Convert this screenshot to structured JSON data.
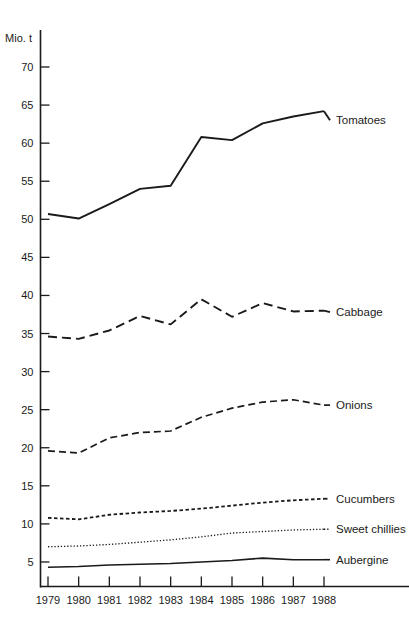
{
  "chart_data": {
    "type": "line",
    "title": "",
    "subtitle": "",
    "xlabel": "",
    "ylabel": "Mio. t",
    "unit_label": "Mio. t",
    "x": [
      1979,
      1980,
      1981,
      1982,
      1983,
      1984,
      1985,
      1986,
      1987,
      1988
    ],
    "categories": [
      "1979",
      "1980",
      "1981",
      "1982",
      "1983",
      "1984",
      "1985",
      "1986",
      "1987",
      "1988"
    ],
    "xtick_labels": [
      "1979",
      "1980",
      "1981",
      "1982",
      "1983",
      "1984",
      "1985",
      "1986",
      "1987",
      "1988"
    ],
    "ytick_labels": [
      "5",
      "10",
      "15",
      "20",
      "25",
      "30",
      "35",
      "40",
      "45",
      "50",
      "55",
      "60",
      "65",
      "70"
    ],
    "yticks": [
      5,
      10,
      15,
      20,
      25,
      30,
      35,
      40,
      45,
      50,
      55,
      60,
      65,
      70
    ],
    "ylim": [
      2,
      72
    ],
    "xlim": [
      1979,
      1988
    ],
    "grid": false,
    "legend": "inline-right-labels",
    "series": [
      {
        "name": "Tomatoes",
        "label": "Tomatoes",
        "style": "solid",
        "stroke_width": 1.9,
        "dasharray": "",
        "values": [
          50.7,
          50.1,
          52.0,
          54.0,
          54.4,
          60.8,
          60.4,
          62.6,
          63.5,
          64.2
        ],
        "label_y": 63.0
      },
      {
        "name": "Cabbage",
        "label": "Cabbage",
        "style": "long-dash",
        "stroke_width": 1.9,
        "dasharray": "9,5",
        "values": [
          34.6,
          34.3,
          35.4,
          37.3,
          36.2,
          39.5,
          37.2,
          39.0,
          37.9,
          38.0
        ],
        "label_y": 37.8
      },
      {
        "name": "Onions",
        "label": "Onions",
        "style": "medium-dash",
        "stroke_width": 1.7,
        "dasharray": "7,4",
        "values": [
          19.6,
          19.3,
          21.3,
          22.0,
          22.2,
          24.0,
          25.2,
          26.0,
          26.3,
          25.6
        ],
        "label_y": 25.6
      },
      {
        "name": "Cucumbers",
        "label": "Cucumbers",
        "style": "short-dash",
        "stroke_width": 1.8,
        "dasharray": "3.5,2.5",
        "values": [
          10.8,
          10.6,
          11.2,
          11.5,
          11.7,
          12.0,
          12.4,
          12.8,
          13.1,
          13.3
        ],
        "label_y": 13.3
      },
      {
        "name": "Sweet chillies",
        "label": "Sweet chillies",
        "style": "dotted",
        "stroke_width": 1.3,
        "dasharray": "1.3,1.9",
        "values": [
          7.0,
          7.1,
          7.3,
          7.6,
          7.9,
          8.3,
          8.8,
          9.0,
          9.2,
          9.3
        ],
        "label_y": 9.3
      },
      {
        "name": "Aubergine",
        "label": "Aubergine",
        "style": "solid",
        "stroke_width": 1.6,
        "dasharray": "",
        "values": [
          4.3,
          4.4,
          4.6,
          4.7,
          4.8,
          5.0,
          5.2,
          5.5,
          5.3,
          5.3
        ],
        "label_y": 5.3
      }
    ]
  },
  "colors": {
    "ink": "#1a1a1a",
    "background": "#ffffff"
  }
}
